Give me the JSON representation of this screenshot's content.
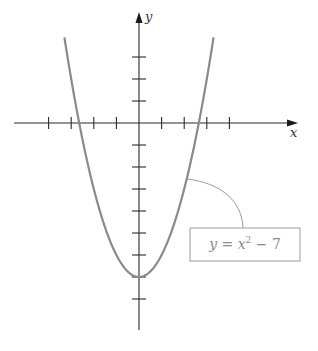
{
  "chart_data": {
    "type": "line",
    "title": "",
    "xlabel": "x",
    "ylabel": "y",
    "function": "y = x^2 - 7",
    "annotation": {
      "text": "y = x² − 7",
      "parts": [
        "y",
        " = ",
        "x",
        "2",
        " − 7"
      ]
    },
    "x_ticks": [
      -4,
      -3,
      -2,
      -1,
      1,
      2,
      3,
      4
    ],
    "y_ticks": [
      -8,
      -7,
      -6,
      -5,
      -4,
      -3,
      -2,
      -1,
      1,
      2,
      3
    ],
    "tick_labels_shown": false,
    "xlim": [
      -5.5,
      7
    ],
    "ylim": [
      -9.5,
      5
    ],
    "x": [
      -3.3,
      -3,
      -2.5,
      -2,
      -1.5,
      -1,
      -0.5,
      0,
      0.5,
      1,
      1.5,
      2,
      2.5,
      3,
      3.3
    ],
    "y": [
      3.89,
      2,
      -0.75,
      -3,
      -4.75,
      -6,
      -6.75,
      -7,
      -6.75,
      -6,
      -4.75,
      -3,
      -0.75,
      2,
      3.89
    ],
    "vertex": [
      0,
      -7
    ],
    "x_intercepts": [
      -2.646,
      2.646
    ],
    "grid": false,
    "legend": null,
    "colors": {
      "curve": "#8a8a8a",
      "axes": "#2a2a2a",
      "callout": "#9a9a9a"
    }
  },
  "labels": {
    "x_axis": "x",
    "y_axis": "y"
  }
}
